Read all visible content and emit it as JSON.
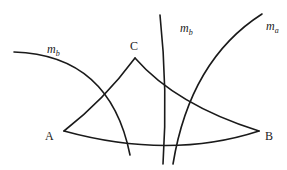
{
  "diagram": {
    "type": "geometry",
    "stroke_color": "#1a1a1a",
    "vertices": {
      "A": {
        "label": "A",
        "x": 64,
        "y": 131
      },
      "B": {
        "label": "B",
        "x": 259,
        "y": 131
      },
      "C": {
        "label": "C",
        "x": 135,
        "y": 58
      }
    },
    "curves": [
      {
        "id": "side-AC",
        "from": "A",
        "to": "C"
      },
      {
        "id": "side-CB",
        "from": "C",
        "to": "B"
      },
      {
        "id": "side-AB",
        "from": "A",
        "to": "B"
      },
      {
        "id": "median-mb-left",
        "label": "m",
        "subscript": "b"
      },
      {
        "id": "median-mb-middle",
        "label": "m",
        "subscript": "b"
      },
      {
        "id": "median-ma",
        "label": "m",
        "subscript": "a"
      }
    ],
    "labels": {
      "A": "A",
      "B": "B",
      "C": "C",
      "mb_left": {
        "main": "m",
        "sub": "b"
      },
      "mb_middle": {
        "main": "m",
        "sub": "b"
      },
      "ma": {
        "main": "m",
        "sub": "a"
      }
    }
  }
}
